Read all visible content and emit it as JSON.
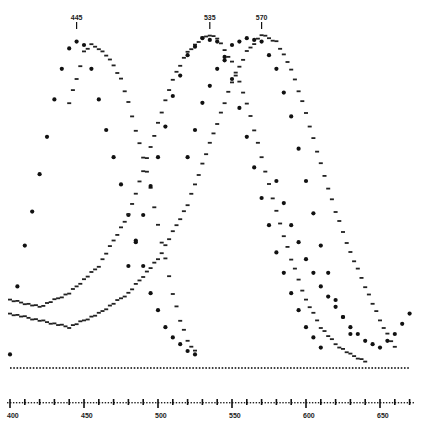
{
  "chart_data": {
    "type": "scatter",
    "title": "",
    "xlabel": "",
    "ylabel": "",
    "xlim": [
      400,
      670
    ],
    "ylim": [
      0,
      1.0
    ],
    "grid": false,
    "legend": null,
    "x_ticks": [
      400,
      450,
      500,
      550,
      600,
      650
    ],
    "x_tick_labels": [
      "400",
      "450",
      "500",
      "550",
      "600",
      "650"
    ],
    "annotations": [
      {
        "label": "445",
        "x": 445
      },
      {
        "label": "535",
        "x": 535
      },
      {
        "label": "570",
        "x": 570
      }
    ],
    "series": [
      {
        "name": "blue-sensitive (peak 445)",
        "marker": "large-dot",
        "x": [
          400,
          405,
          410,
          415,
          420,
          425,
          430,
          435,
          440,
          445,
          450,
          455,
          460,
          465,
          470,
          475,
          480,
          485,
          490,
          495,
          500,
          505,
          510,
          515,
          520,
          525
        ],
        "y": [
          0.04,
          0.24,
          0.36,
          0.46,
          0.57,
          0.68,
          0.79,
          0.88,
          0.94,
          0.96,
          0.95,
          0.88,
          0.79,
          0.7,
          0.62,
          0.54,
          0.45,
          0.37,
          0.3,
          0.22,
          0.17,
          0.12,
          0.09,
          0.07,
          0.05,
          0.04
        ]
      },
      {
        "name": "blue-sensitive alt (peak ~455)",
        "marker": "small-dash",
        "x": [
          440,
          445,
          450,
          455,
          460,
          465,
          470,
          475,
          480,
          485,
          490,
          495,
          500,
          505,
          510,
          515,
          520,
          525
        ],
        "y": [
          0.78,
          0.85,
          0.93,
          0.95,
          0.94,
          0.92,
          0.89,
          0.85,
          0.78,
          0.7,
          0.62,
          0.53,
          0.42,
          0.32,
          0.22,
          0.14,
          0.08,
          0.05
        ]
      },
      {
        "name": "green-sensitive (peak 535)",
        "marker": "small-dash",
        "x": [
          400,
          420,
          440,
          460,
          480,
          490,
          500,
          510,
          520,
          530,
          535,
          540,
          550,
          560,
          570,
          580,
          590,
          600,
          610,
          620,
          630,
          640
        ],
        "y": [
          0.2,
          0.18,
          0.22,
          0.3,
          0.45,
          0.58,
          0.72,
          0.85,
          0.93,
          0.97,
          0.98,
          0.97,
          0.9,
          0.78,
          0.62,
          0.46,
          0.32,
          0.2,
          0.12,
          0.07,
          0.04,
          0.02
        ]
      },
      {
        "name": "green-sensitive large dots",
        "marker": "large-dot",
        "x": [
          480,
          490,
          500,
          510,
          520,
          530,
          540,
          550,
          560,
          570,
          580,
          590,
          600,
          610
        ],
        "y": [
          0.3,
          0.45,
          0.62,
          0.8,
          0.92,
          0.97,
          0.96,
          0.85,
          0.68,
          0.5,
          0.34,
          0.22,
          0.12,
          0.06
        ]
      },
      {
        "name": "red-sensitive (peak 570)",
        "marker": "small-dash",
        "x": [
          400,
          420,
          440,
          460,
          480,
          500,
          520,
          540,
          550,
          560,
          570,
          580,
          590,
          600,
          610,
          620,
          630,
          640,
          650,
          660
        ],
        "y": [
          0.16,
          0.14,
          0.12,
          0.16,
          0.22,
          0.32,
          0.48,
          0.72,
          0.84,
          0.93,
          0.98,
          0.96,
          0.88,
          0.75,
          0.6,
          0.46,
          0.34,
          0.24,
          0.14,
          0.06
        ]
      },
      {
        "name": "red-sensitive large dots",
        "marker": "large-dot",
        "x": [
          520,
          530,
          540,
          550,
          560,
          570,
          580,
          590,
          600,
          610,
          620,
          630
        ],
        "y": [
          0.62,
          0.78,
          0.88,
          0.95,
          0.97,
          0.96,
          0.88,
          0.74,
          0.55,
          0.36,
          0.2,
          0.1
        ]
      },
      {
        "name": "long-wave tail curve",
        "marker": "large-dot",
        "x": [
          580,
          590,
          600,
          610,
          620,
          630,
          640,
          650,
          660,
          670
        ],
        "y": [
          0.55,
          0.42,
          0.32,
          0.24,
          0.18,
          0.12,
          0.08,
          0.06,
          0.1,
          0.16
        ]
      },
      {
        "name": "baseline",
        "marker": "tiny-dot",
        "x": [
          400,
          670
        ],
        "y": [
          0.0,
          0.0
        ]
      }
    ]
  }
}
